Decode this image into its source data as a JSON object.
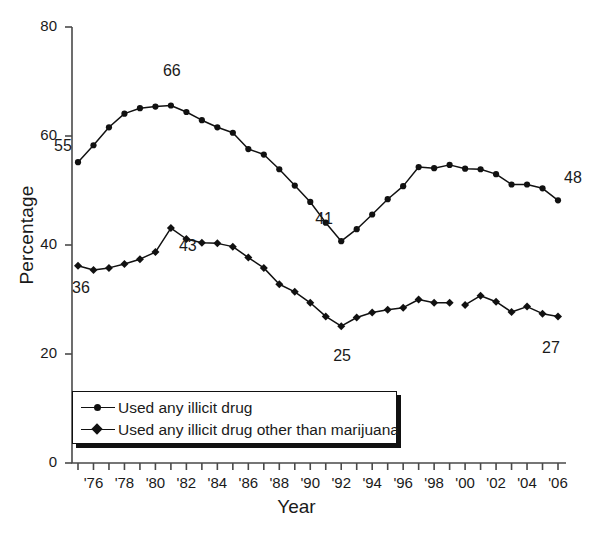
{
  "chart_data": {
    "type": "line",
    "title": "",
    "xlabel": "Year",
    "ylabel": "Percentage",
    "ylim": [
      0,
      80
    ],
    "yticks": [
      0,
      20,
      40,
      60,
      80
    ],
    "xlim": [
      1975,
      2006
    ],
    "xtick_labels": [
      "'76",
      "'78",
      "'80",
      "'82",
      "'84",
      "'86",
      "'88",
      "'90",
      "'92",
      "'94",
      "'96",
      "'98",
      "'00",
      "'02",
      "'04",
      "'06"
    ],
    "xtick_years": [
      1976,
      1978,
      1980,
      1982,
      1984,
      1986,
      1988,
      1990,
      1992,
      1994,
      1996,
      1998,
      2000,
      2002,
      2004,
      2006
    ],
    "minor_tick_years": [
      1975,
      1976,
      1977,
      1978,
      1979,
      1980,
      1981,
      1982,
      1983,
      1984,
      1985,
      1986,
      1987,
      1988,
      1989,
      1990,
      1991,
      1992,
      1993,
      1994,
      1995,
      1996,
      1997,
      1998,
      1999,
      2000,
      2001,
      2002,
      2003,
      2004,
      2005,
      2006
    ],
    "grid": false,
    "legend_position": "lower-left-inside",
    "x": [
      1975,
      1976,
      1977,
      1978,
      1979,
      1980,
      1981,
      1982,
      1983,
      1984,
      1985,
      1986,
      1987,
      1988,
      1989,
      1990,
      1991,
      1992,
      1993,
      1994,
      1995,
      1996,
      1997,
      1998,
      1999,
      2000,
      2001,
      2002,
      2003,
      2004,
      2005,
      2006
    ],
    "series": [
      {
        "name": "Used any illicit drug",
        "marker": "circle",
        "values": [
          55.2,
          58.3,
          61.6,
          64.1,
          65.1,
          65.4,
          65.6,
          64.4,
          62.9,
          61.6,
          60.6,
          57.6,
          56.6,
          53.9,
          50.9,
          47.9,
          44.1,
          40.7,
          42.9,
          45.6,
          48.4,
          50.8,
          54.3,
          54.1,
          54.7,
          54.0,
          53.9,
          53.0,
          51.1,
          51.1,
          50.4,
          48.2
        ]
      },
      {
        "name": "Used any illicit drug other than marijuana",
        "marker": "diamond",
        "values": [
          36.2,
          35.4,
          35.8,
          36.5,
          37.4,
          38.7,
          43.1,
          41.1,
          40.4,
          40.3,
          39.7,
          37.7,
          35.8,
          32.8,
          31.4,
          29.4,
          26.9,
          25.1,
          26.7,
          27.6,
          28.1,
          28.5,
          30.0,
          29.4,
          29.4,
          29.0,
          30.7,
          29.6,
          27.7,
          28.7,
          27.4,
          26.9
        ]
      }
    ],
    "annotations": [
      {
        "label": "55",
        "year": 1975,
        "value": 55.2,
        "dx": -24,
        "dy": -16
      },
      {
        "label": "66",
        "year": 1981,
        "value": 65.6,
        "dx": -8,
        "dy": -34
      },
      {
        "label": "41",
        "year": 1992,
        "value": 40.7,
        "dx": -26,
        "dy": -22
      },
      {
        "label": "48",
        "year": 2006,
        "value": 48.2,
        "dx": 6,
        "dy": -22
      },
      {
        "label": "36",
        "year": 1975,
        "value": 36.2,
        "dx": -6,
        "dy": 22
      },
      {
        "label": "43",
        "year": 1981,
        "value": 43.1,
        "dx": 8,
        "dy": 18
      },
      {
        "label": "25",
        "year": 1992,
        "value": 25.1,
        "dx": -8,
        "dy": 30
      },
      {
        "label": "27",
        "year": 2006,
        "value": 26.9,
        "dx": -16,
        "dy": 32
      }
    ]
  },
  "axes": {
    "y_label": "Percentage",
    "x_label": "Year",
    "y_tick_labels": [
      "0",
      "20",
      "40",
      "60",
      "80"
    ]
  },
  "legend": {
    "items": [
      {
        "label": "Used any illicit drug",
        "marker": "circle"
      },
      {
        "label": "Used any illicit drug other than marijuana",
        "marker": "diamond"
      }
    ]
  },
  "colors": {
    "line": "#111111",
    "marker": "#111111",
    "axis": "#4a4a4a",
    "text": "#1a1a1a",
    "background": "#ffffff"
  }
}
